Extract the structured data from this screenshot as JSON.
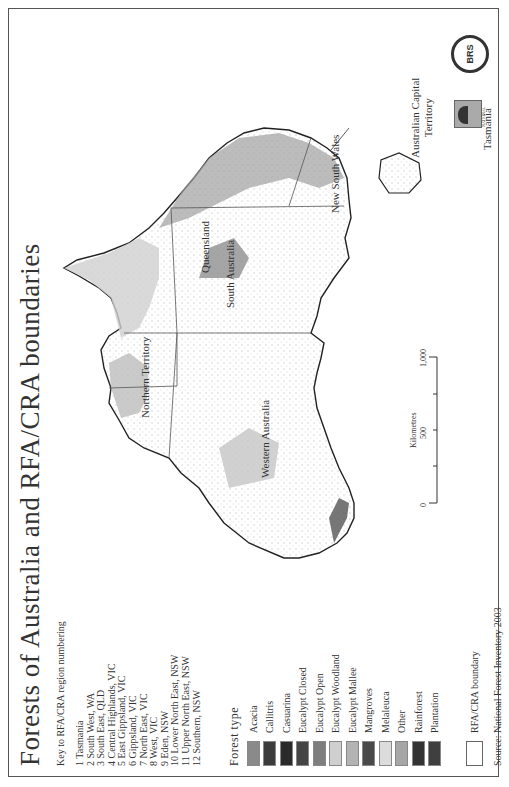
{
  "map": {
    "title": "Forests of Australia and RFA/CRA boundaries",
    "key": {
      "title": "Key to RFA/CRA region numbering",
      "regions": [
        "1 Tasmania",
        "2 South West, WA",
        "3 South East, QLD",
        "4 Central Highlands, VIC",
        "5 East Gippsland, VIC",
        "6 Gippsland, VIC",
        "7 North East, VIC",
        "8 West, VIC",
        "9 Eden, NSW",
        "10 Lower North East, NSW",
        "11 Upper North East, NSW",
        "12 Southern, NSW"
      ]
    },
    "forest_type": {
      "title": "Forest type",
      "items": [
        {
          "label": "Acacia",
          "color": "#8a8a8a"
        },
        {
          "label": "Callitris",
          "color": "#3c3c3c"
        },
        {
          "label": "Casuarina",
          "color": "#2a2a2a"
        },
        {
          "label": "Eucalypt Closed",
          "color": "#454545"
        },
        {
          "label": "Eucalypt Open",
          "color": "#7e7e7e"
        },
        {
          "label": "Eucalypt Woodland",
          "color": "#cfcfcf"
        },
        {
          "label": "Eucalypt Mallee",
          "color": "#b3b3b3"
        },
        {
          "label": "Mangroves",
          "color": "#4a4a4a"
        },
        {
          "label": "Melaleuca",
          "color": "#dcdcdc"
        },
        {
          "label": "Other",
          "color": "#a6a6a6"
        },
        {
          "label": "Rainforest",
          "color": "#333333"
        },
        {
          "label": "Plantation",
          "color": "#3f3f3f"
        }
      ]
    },
    "boundary_legend": {
      "label": "RFA/CRA boundary",
      "color": "#ffffff"
    },
    "source": "Source: National Forest Inventory 2003",
    "region_labels": {
      "wa": "Western Australia",
      "nt": "Northern Territory",
      "sa": "South Australia",
      "qld": "Queensland",
      "nsw": "New South Wales",
      "act": "Australian Capital Territory",
      "act_line1": "Australian Capital",
      "act_line2": "Territory",
      "tas": "Tasmania"
    },
    "region_numbers": [
      "8",
      "8"
    ],
    "scale_bar": {
      "unit": "Kilometres",
      "ticks": [
        "0",
        "500",
        "1,000"
      ]
    },
    "logos": [
      "BRS",
      "NATIONAL"
    ]
  }
}
